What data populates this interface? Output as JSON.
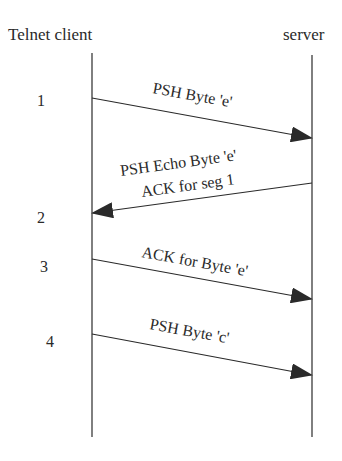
{
  "diagram": {
    "type": "sequence",
    "actors": [
      {
        "id": "client",
        "label": "Telnet client",
        "x": 92,
        "label_x": 8,
        "label_y": 40
      },
      {
        "id": "server",
        "label": "server",
        "x": 312,
        "label_x": 283,
        "label_y": 40
      }
    ],
    "lifeline": {
      "top": 53,
      "bottom": 437
    },
    "steps": [
      {
        "number": "1",
        "x": 41,
        "y": 106
      },
      {
        "number": "2",
        "x": 37,
        "y": 223
      },
      {
        "number": "3",
        "x": 40,
        "y": 272
      },
      {
        "number": "4",
        "x": 46,
        "y": 347
      }
    ],
    "messages": [
      {
        "from": "client",
        "to": "server",
        "y_start": 98,
        "y_end": 138,
        "lines": [
          "PSH Byte 'e'"
        ]
      },
      {
        "from": "server",
        "to": "client",
        "y_start": 183,
        "y_end": 213,
        "lines": [
          "PSH Echo Byte 'e'",
          "ACK for seg 1"
        ]
      },
      {
        "from": "client",
        "to": "server",
        "y_start": 259,
        "y_end": 299,
        "lines": [
          "ACK for Byte 'e'"
        ]
      },
      {
        "from": "client",
        "to": "server",
        "y_start": 334,
        "y_end": 375,
        "lines": [
          "PSH Byte 'c'"
        ]
      }
    ],
    "colors": {
      "line": "#2a2a2a",
      "text": "#2a2a2a",
      "background": "#ffffff"
    }
  }
}
